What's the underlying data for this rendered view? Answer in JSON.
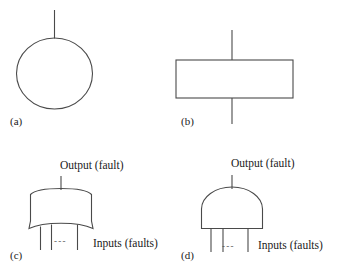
{
  "figure": {
    "background_color": "#ffffff",
    "stroke_color": "#4a4a4a",
    "text_color": "#1b1b1b",
    "panels": [
      {
        "tag": "(a)",
        "symbol": "circle-with-stem",
        "description": "circle event symbol with vertical stem on top",
        "labels": []
      },
      {
        "tag": "(b)",
        "symbol": "rectangle-with-stems",
        "description": "rectangle event symbol with vertical stems on top and bottom",
        "labels": []
      },
      {
        "tag": "(c)",
        "symbol": "or-gate",
        "description": "OR gate with curved bottom, one output stem and three input stems",
        "labels": [
          "Output (fault)",
          "Inputs (faults)"
        ],
        "ellipsis": "- - -"
      },
      {
        "tag": "(d)",
        "symbol": "and-gate",
        "description": "AND gate with flat bottom and domed top, one output stem and three input stems",
        "labels": [
          "Output (fault)",
          "Inputs (faults)"
        ],
        "ellipsis": "- - -"
      }
    ],
    "tags": {
      "a": "(a)",
      "b": "(b)",
      "c": "(c)",
      "d": "(d)"
    },
    "text": {
      "output_fault": "Output (fault)",
      "inputs_faults": "Inputs (faults)",
      "ellipsis": "- - -"
    }
  }
}
